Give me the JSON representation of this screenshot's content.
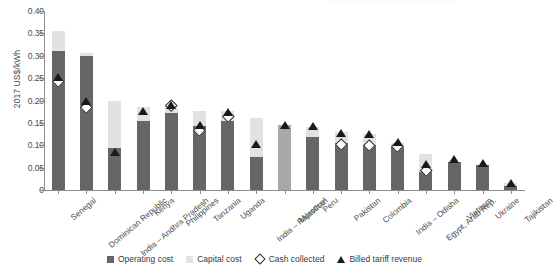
{
  "axes": {
    "y_title": "2017 US$/kWh",
    "y_ticks": [
      "0.40",
      "0.35",
      "0.30",
      "0.25",
      "0.20",
      "0.15",
      "0.10",
      "0.05",
      "0"
    ]
  },
  "legend": {
    "items": [
      {
        "label": "Operating cost",
        "marker": "square",
        "color": "#666666"
      },
      {
        "label": "Capital cost",
        "marker": "square",
        "color": "#e2e2e2"
      },
      {
        "label": "Cash collected",
        "marker": "diamond-open",
        "color": "#ffffff"
      },
      {
        "label": "Billed tariff revenue",
        "marker": "triangle-filled",
        "color": "#1a1a1a"
      }
    ]
  },
  "chart_data": {
    "type": "bar",
    "title": "",
    "subtitle": "",
    "xlabel": "",
    "ylabel": "2017 US$/kWh",
    "ylim": [
      0,
      0.4
    ],
    "ytick_step": 0.05,
    "grid": false,
    "legend_position": "bottom-center",
    "stacked": true,
    "categories": [
      "Senegal",
      "Dominican Republic",
      "India – Andhra Pradesh",
      "Kenya",
      "Philippines",
      "Tanzania",
      "Uganda",
      "India – Rajasthan",
      "Morocco²",
      "Peru",
      "Pakistan",
      "Colombia",
      "India – Odisha",
      "Egypt, Arab Rep.",
      "Vietnam",
      "Ukraine",
      "Tajikistan"
    ],
    "series": [
      {
        "name": "Operating cost",
        "type": "bar-segment",
        "color": "#666666",
        "values": [
          0.31,
          0.299,
          0.094,
          0.154,
          0.173,
          0.144,
          0.155,
          0.073,
          null,
          0.118,
          0.104,
          0.1,
          0.098,
          0.04,
          0.062,
          0.055,
          0.01
        ]
      },
      {
        "name": "Capital cost",
        "type": "bar-segment",
        "color": "#e2e2e2",
        "values": [
          0.045,
          0.007,
          0.106,
          0.031,
          0.017,
          0.032,
          0.021,
          0.087,
          null,
          0.023,
          0.025,
          0.025,
          0.007,
          0.04,
          0.0,
          0.0,
          0.005
        ]
      },
      {
        "name": "Total (Operating + Capital)",
        "type": "bar-total",
        "values": [
          0.355,
          0.306,
          0.2,
          0.185,
          0.19,
          0.176,
          0.176,
          0.16,
          0.146,
          0.141,
          0.129,
          0.125,
          0.105,
          0.08,
          0.062,
          0.055,
          0.015
        ]
      },
      {
        "name": "Morocco combined cost",
        "type": "bar-single",
        "color": "#a8a8a8",
        "values": [
          null,
          null,
          null,
          null,
          null,
          null,
          null,
          null,
          0.146,
          null,
          null,
          null,
          null,
          null,
          null,
          null,
          null
        ]
      },
      {
        "name": "Cash collected",
        "type": "marker-diamond",
        "color": "#ffffff",
        "values": [
          0.244,
          0.186,
          null,
          null,
          0.19,
          0.133,
          0.165,
          null,
          null,
          null,
          0.103,
          0.1,
          0.098,
          0.045,
          null,
          null,
          null
        ]
      },
      {
        "name": "Billed tariff revenue",
        "type": "marker-triangle",
        "color": "#1a1a1a",
        "values": [
          0.25,
          0.196,
          0.083,
          0.175,
          0.188,
          0.143,
          0.171,
          0.1,
          0.142,
          0.14,
          0.126,
          0.124,
          0.104,
          0.055,
          0.066,
          0.059,
          0.014
        ]
      }
    ]
  }
}
